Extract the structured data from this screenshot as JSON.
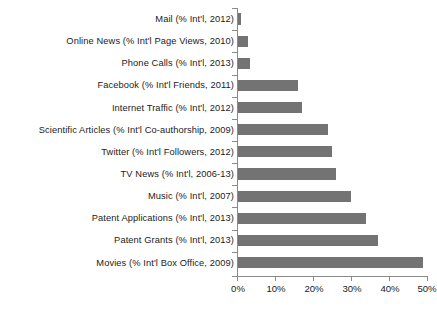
{
  "chart_data": {
    "type": "bar",
    "orientation": "horizontal",
    "title": "",
    "subtitle": "",
    "xlabel": "",
    "ylabel": "",
    "xlim": [
      0,
      50
    ],
    "xticks": [
      0,
      10,
      20,
      30,
      40,
      50
    ],
    "xtick_labels": [
      "0%",
      "10%",
      "20%",
      "30%",
      "40%",
      "50%"
    ],
    "grid": false,
    "legend": false,
    "legend_position": "none",
    "bar_color": "#737373",
    "axis_color": "#8a8a8a",
    "text_color": "#1b1b1b",
    "categories": [
      "Mail (% Int'l, 2012)",
      "Online News (% Int'l Page Views, 2010)",
      "Phone Calls (% Int'l, 2013)",
      "Facebook (% Int'l Friends, 2011)",
      "Internet Traffic (% Int'l, 2012)",
      "Scientific Articles (% Int'l Co-authorship, 2009)",
      "Twitter (% Int'l Followers, 2012)",
      "TV News (% Int'l, 2006-13)",
      "Music (% Int'l, 2007)",
      "Patent Applications (% Int'l, 2013)",
      "Patent Grants (% Int'l, 2013)",
      "Movies (% Int'l Box Office, 2009)"
    ],
    "values": [
      1,
      3,
      3.5,
      16,
      17,
      24,
      25,
      26,
      30,
      34,
      37,
      49
    ],
    "value_labels": [
      "1%",
      "3%",
      "3.5%",
      "16%",
      "17%",
      "24%",
      "25%",
      "26%",
      "30%",
      "34%",
      "37%",
      "49%"
    ]
  }
}
